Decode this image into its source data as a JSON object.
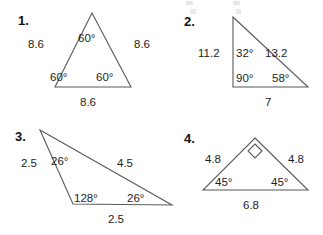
{
  "page": {
    "width": 323,
    "height": 235,
    "background": "#ffffff",
    "line_color": "#595959",
    "text_color": "#1d1d1d"
  },
  "problems": [
    {
      "number": "1.",
      "shape": "equilateral-triangle",
      "sides": [
        "8.6",
        "8.6",
        "8.6"
      ],
      "angles": [
        "60°",
        "60°",
        "60°"
      ],
      "side_left": "8.6",
      "side_right": "8.6",
      "side_bottom": "8.6",
      "angle_top": "60°",
      "angle_bottom_left": "60°",
      "angle_bottom_right": "60°",
      "right_angle_mark": false
    },
    {
      "number": "2.",
      "shape": "right-triangle",
      "sides": [
        "11.2",
        "13.2",
        "7"
      ],
      "angles": [
        "32°",
        "90°",
        "58°"
      ],
      "side_left": "11.2",
      "side_right": "13.2",
      "side_bottom": "7",
      "angle_top": "32°",
      "angle_bottom_left": "90°",
      "angle_bottom_right": "58°",
      "right_angle_mark": false
    },
    {
      "number": "3.",
      "shape": "obtuse-triangle",
      "sides": [
        "2.5",
        "4.5",
        "2.5"
      ],
      "angles": [
        "26°",
        "128°",
        "26°"
      ],
      "side_left": "2.5",
      "side_right": "4.5",
      "side_bottom": "2.5",
      "angle_top": "26°",
      "angle_bottom_left": "128°",
      "angle_bottom_right": "26°",
      "right_angle_mark": false
    },
    {
      "number": "4.",
      "shape": "right-isosceles-triangle",
      "sides": [
        "4.8",
        "4.8",
        "6.8"
      ],
      "angles": [
        "45°",
        "45°"
      ],
      "side_left": "4.8",
      "side_right": "4.8",
      "side_bottom": "6.8",
      "angle_top": "",
      "angle_bottom_left": "45°",
      "angle_bottom_right": "45°",
      "right_angle_mark": true
    }
  ]
}
